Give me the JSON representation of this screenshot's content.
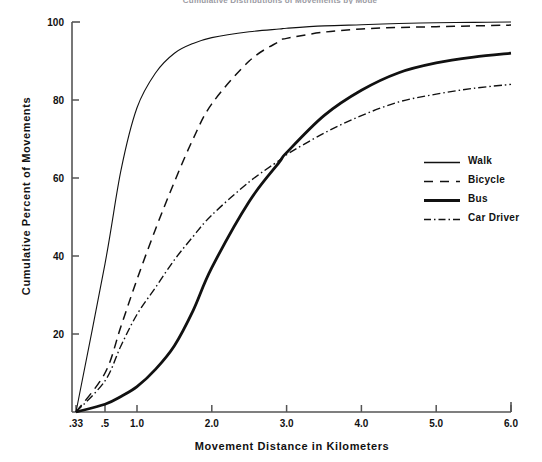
{
  "figure": {
    "clipped_header": "Cumulative Distributions of Movements by Mode"
  },
  "chart_data": {
    "type": "line",
    "title": "",
    "xlabel": "Movement Distance in Kilometers",
    "ylabel": "Cumulative Percent of Movements",
    "xlim": [
      0.33,
      6.0
    ],
    "ylim": [
      0,
      100
    ],
    "grid": false,
    "legend_position": "right-middle",
    "xticks": [
      ".33",
      ".5",
      "1.0",
      "2.0",
      "3.0",
      "4.0",
      "5.0",
      "6.0"
    ],
    "xtick_values": [
      0.33,
      0.5,
      1.0,
      2.0,
      3.0,
      4.0,
      5.0,
      6.0
    ],
    "yticks": [
      "20",
      "40",
      "60",
      "80",
      "100"
    ],
    "ytick_values": [
      20,
      40,
      60,
      80,
      100
    ],
    "x": [
      0.33,
      0.5,
      0.75,
      1.0,
      1.25,
      1.5,
      1.75,
      2.0,
      2.5,
      2.9,
      3.0,
      3.5,
      4.0,
      4.5,
      5.0,
      5.5,
      6.0
    ],
    "series": [
      {
        "name": "Walk",
        "style": "solid-thin",
        "values": [
          0,
          38,
          62,
          78,
          87,
          92,
          94.5,
          96,
          97.5,
          98.2,
          98.4,
          99.0,
          99.3,
          99.6,
          99.8,
          99.9,
          100
        ]
      },
      {
        "name": "Bicycle",
        "style": "dashed",
        "values": [
          0,
          10,
          22,
          34,
          47,
          59,
          70,
          79,
          90,
          95,
          95.8,
          97.4,
          98.2,
          98.6,
          98.8,
          99.0,
          99.2
        ]
      },
      {
        "name": "Bus",
        "style": "solid-thick",
        "values": [
          0,
          2,
          4,
          6.5,
          11,
          17,
          26,
          37,
          54,
          64,
          66.5,
          76,
          82.5,
          87,
          89.5,
          91,
          92
        ]
      },
      {
        "name": "Car Driver",
        "style": "dash-dot",
        "values": [
          0,
          8,
          17,
          25,
          32,
          39,
          45,
          50.5,
          59,
          64.5,
          66,
          71.5,
          76,
          79.5,
          81.5,
          83,
          84
        ]
      }
    ]
  },
  "legend": {
    "items": [
      {
        "label": "Walk",
        "style": "solid-thin"
      },
      {
        "label": "Bicycle",
        "style": "dashed"
      },
      {
        "label": "Bus",
        "style": "solid-thick"
      },
      {
        "label": "Car Driver",
        "style": "dash-dot"
      }
    ]
  },
  "colors": {
    "line": "#111111",
    "axis": "#555555",
    "text": "#111111",
    "background": "#ffffff"
  }
}
